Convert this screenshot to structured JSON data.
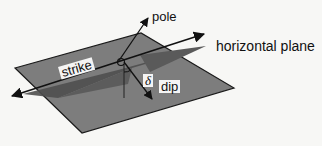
{
  "diagram": {
    "labels": {
      "pole": "pole",
      "horizontal_plane": "horizontal plane",
      "strike": "strike",
      "delta": "δ",
      "dip": "dip"
    },
    "colors": {
      "background": "#f7f7f5",
      "inclined_plane": "#7b7b7b",
      "horizontal_plane": "#555555",
      "outline": "#1a1a1a",
      "label_box": "#f4f4f4"
    }
  }
}
